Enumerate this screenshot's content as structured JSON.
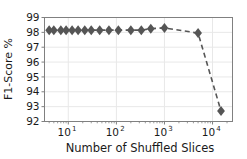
{
  "chart_data": {
    "type": "line",
    "title": "",
    "xlabel": "Number of Shuffled Slices",
    "ylabel": "F1-Score %",
    "xscale": "log",
    "yscale": "linear",
    "xlim": [
      3.2,
      26000
    ],
    "ylim": [
      92,
      99
    ],
    "yticks": [
      92,
      93,
      94,
      95,
      96,
      97,
      98,
      99
    ],
    "ytick_labels": [
      "92",
      "93",
      "94",
      "95",
      "96",
      "97",
      "98",
      "99"
    ],
    "xticks": [
      10,
      100,
      1000,
      10000
    ],
    "xtick_labels": [
      "10¹",
      "10²",
      "10³",
      "10⁴"
    ],
    "xtick_mantissa": [
      "10",
      "10",
      "10",
      "10"
    ],
    "xtick_exponents": [
      "1",
      "2",
      "3",
      "4"
    ],
    "grid": true,
    "grid_color": "#e8e8e8",
    "legend": null,
    "line_color": "#555555",
    "line_style": "dashed",
    "marker": "diamond",
    "marker_color": "#555555",
    "marker_size": 5,
    "x": [
      4,
      5,
      7,
      9,
      12,
      16,
      22,
      30,
      45,
      70,
      110,
      200,
      330,
      520,
      1000,
      5000,
      15000
    ],
    "y": [
      98.15,
      98.15,
      98.15,
      98.15,
      98.15,
      98.15,
      98.15,
      98.15,
      98.15,
      98.15,
      98.15,
      98.15,
      98.15,
      98.25,
      98.3,
      97.95,
      92.7
    ],
    "points": [
      {
        "x": 4,
        "y": 98.15
      },
      {
        "x": 5,
        "y": 98.15
      },
      {
        "x": 7,
        "y": 98.15
      },
      {
        "x": 9,
        "y": 98.15
      },
      {
        "x": 12,
        "y": 98.15
      },
      {
        "x": 16,
        "y": 98.15
      },
      {
        "x": 22,
        "y": 98.15
      },
      {
        "x": 30,
        "y": 98.15
      },
      {
        "x": 45,
        "y": 98.15
      },
      {
        "x": 70,
        "y": 98.15
      },
      {
        "x": 110,
        "y": 98.15
      },
      {
        "x": 200,
        "y": 98.15
      },
      {
        "x": 330,
        "y": 98.15
      },
      {
        "x": 520,
        "y": 98.25
      },
      {
        "x": 1000,
        "y": 98.3
      },
      {
        "x": 5000,
        "y": 97.95
      },
      {
        "x": 15000,
        "y": 92.7
      }
    ]
  },
  "figure": {
    "background_color": "#ffffff",
    "axes_edge_color": "#808080",
    "text_color": "#1a1a1a"
  }
}
